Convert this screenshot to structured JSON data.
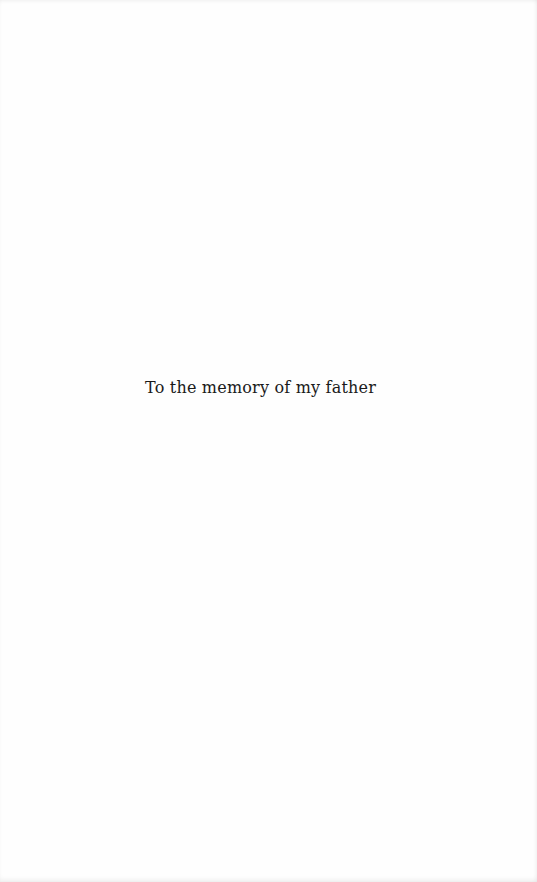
{
  "page": {
    "dedication": "To the memory of my father"
  }
}
